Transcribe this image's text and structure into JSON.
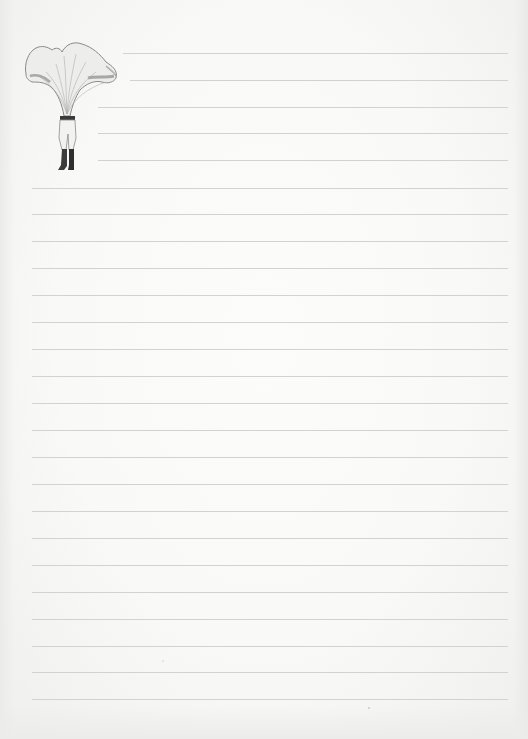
{
  "page": {
    "type": "lined-notepaper",
    "background_color": "#f7f7f6",
    "rule_color": "#d2d2d0",
    "rule_spacing_px": 27
  },
  "illustration": {
    "subject": "chanterelle-mushroom-headed-figure",
    "description": "Vintage engraving of a figure with a chanterelle mushroom cap for a head, wearing light trousers and dark boots"
  },
  "rules": [
    {
      "y": 53,
      "x1": 123,
      "x2": 508
    },
    {
      "y": 80,
      "x1": 130,
      "x2": 508
    },
    {
      "y": 107,
      "x1": 98,
      "x2": 508
    },
    {
      "y": 133,
      "x1": 98,
      "x2": 508
    },
    {
      "y": 160,
      "x1": 98,
      "x2": 508
    },
    {
      "y": 188,
      "x1": 32,
      "x2": 508
    },
    {
      "y": 214,
      "x1": 32,
      "x2": 508
    },
    {
      "y": 241,
      "x1": 32,
      "x2": 508
    },
    {
      "y": 268,
      "x1": 32,
      "x2": 508
    },
    {
      "y": 295,
      "x1": 32,
      "x2": 508
    },
    {
      "y": 322,
      "x1": 32,
      "x2": 508
    },
    {
      "y": 349,
      "x1": 32,
      "x2": 508
    },
    {
      "y": 376,
      "x1": 32,
      "x2": 508
    },
    {
      "y": 403,
      "x1": 32,
      "x2": 508
    },
    {
      "y": 430,
      "x1": 32,
      "x2": 508
    },
    {
      "y": 457,
      "x1": 32,
      "x2": 508
    },
    {
      "y": 484,
      "x1": 32,
      "x2": 508
    },
    {
      "y": 511,
      "x1": 32,
      "x2": 508
    },
    {
      "y": 538,
      "x1": 32,
      "x2": 508
    },
    {
      "y": 565,
      "x1": 32,
      "x2": 508
    },
    {
      "y": 592,
      "x1": 32,
      "x2": 508
    },
    {
      "y": 619,
      "x1": 32,
      "x2": 508
    },
    {
      "y": 646,
      "x1": 32,
      "x2": 508
    },
    {
      "y": 672,
      "x1": 32,
      "x2": 508
    },
    {
      "y": 699,
      "x1": 32,
      "x2": 508
    }
  ]
}
